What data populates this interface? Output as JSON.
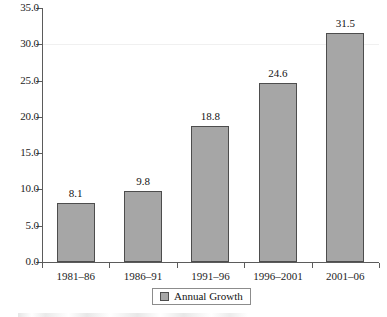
{
  "chart_data": {
    "type": "bar",
    "title": "",
    "subtitle": "",
    "xlabel": "",
    "ylabel": "",
    "categories": [
      "1981–86",
      "1986–91",
      "1991–96",
      "1996–2001",
      "2001–06"
    ],
    "values": [
      8.1,
      9.8,
      18.8,
      24.6,
      31.5
    ],
    "value_labels": [
      "8.1",
      "9.8",
      "18.8",
      "24.6",
      "31.5"
    ],
    "series": [
      {
        "name": "Annual Growth",
        "values": [
          8.1,
          9.8,
          18.8,
          24.6,
          31.5
        ],
        "color": "#a6a6a6"
      }
    ],
    "ylim": [
      0.0,
      35.0
    ],
    "ytick_step": 5.0,
    "ytick_labels": [
      "0.0",
      "5.0",
      "10.0",
      "15.0",
      "20.0",
      "25.0",
      "30.0",
      "35.0"
    ],
    "ytick_values": [
      0.0,
      5.0,
      10.0,
      15.0,
      20.0,
      25.0,
      30.0,
      35.0
    ],
    "grid": false,
    "legend": {
      "position": "bottom",
      "entries": [
        {
          "label": "Annual Growth",
          "swatch_color": "#a6a6a6"
        }
      ]
    },
    "bar_fill_color": "#a6a6a6",
    "bar_border_color": "#4d4d4d",
    "axis_color": "#5b5b5b"
  }
}
